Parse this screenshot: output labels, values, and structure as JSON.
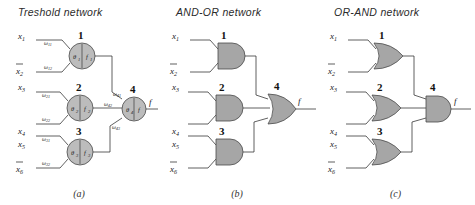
{
  "figure": {
    "caption_a": "(a)",
    "caption_b": "(b)",
    "caption_c": "(c)"
  },
  "panels": {
    "a": {
      "title": "Treshold network",
      "inputs": [
        {
          "base": "x",
          "sub": "1",
          "overbar": false
        },
        {
          "base": "x",
          "sub": "2",
          "overbar": true
        },
        {
          "base": "x",
          "sub": "3",
          "overbar": false
        },
        {
          "base": "x",
          "sub": "4",
          "overbar": false
        },
        {
          "base": "x",
          "sub": "5",
          "overbar": false
        },
        {
          "base": "x",
          "sub": "6",
          "overbar": true
        }
      ],
      "nodes": [
        {
          "number": "1",
          "theta": "θ",
          "theta_sub": "1",
          "func": "f",
          "func_sub": "1"
        },
        {
          "number": "2",
          "theta": "θ",
          "theta_sub": "2",
          "func": "f",
          "func_sub": "2"
        },
        {
          "number": "3",
          "theta": "θ",
          "theta_sub": "3",
          "func": "f",
          "func_sub": "3"
        },
        {
          "number": "4",
          "theta": "θ",
          "theta_sub": "4",
          "func": "f",
          "func_sub": ""
        }
      ],
      "weights": [
        {
          "sym": "ω",
          "sub": "11"
        },
        {
          "sym": "ω",
          "sub": "12"
        },
        {
          "sym": "ω",
          "sub": "21"
        },
        {
          "sym": "ω",
          "sub": "22"
        },
        {
          "sym": "ω",
          "sub": "31"
        },
        {
          "sym": "ω",
          "sub": "32"
        },
        {
          "sym": "ω",
          "sub": "41"
        },
        {
          "sym": "ω",
          "sub": "42"
        },
        {
          "sym": "ω",
          "sub": "43"
        }
      ],
      "output": "f"
    },
    "b": {
      "title": "AND-OR network",
      "inputs": [
        {
          "base": "x",
          "sub": "1",
          "overbar": false
        },
        {
          "base": "x",
          "sub": "2",
          "overbar": true
        },
        {
          "base": "x",
          "sub": "3",
          "overbar": false
        },
        {
          "base": "x",
          "sub": "4",
          "overbar": false
        },
        {
          "base": "x",
          "sub": "5",
          "overbar": false
        },
        {
          "base": "x",
          "sub": "6",
          "overbar": true
        }
      ],
      "gates": [
        {
          "number": "1",
          "type": "AND"
        },
        {
          "number": "2",
          "type": "AND"
        },
        {
          "number": "3",
          "type": "AND"
        },
        {
          "number": "4",
          "type": "OR"
        }
      ],
      "output": "f"
    },
    "c": {
      "title": "OR-AND network",
      "inputs": [
        {
          "base": "x",
          "sub": "1",
          "overbar": false
        },
        {
          "base": "x",
          "sub": "2",
          "overbar": true
        },
        {
          "base": "x",
          "sub": "3",
          "overbar": false
        },
        {
          "base": "x",
          "sub": "4",
          "overbar": false
        },
        {
          "base": "x",
          "sub": "5",
          "overbar": false
        },
        {
          "base": "x",
          "sub": "6",
          "overbar": true
        }
      ],
      "gates": [
        {
          "number": "1",
          "type": "OR"
        },
        {
          "number": "2",
          "type": "OR"
        },
        {
          "number": "3",
          "type": "OR"
        },
        {
          "number": "4",
          "type": "AND"
        }
      ],
      "output": "f"
    }
  },
  "colors": {
    "gate_fill": "#a6a6a6",
    "node_fill": "#bcbcbc",
    "stroke": "#4a4a4a",
    "wire": "#2c2c2c",
    "background": "#ffffff"
  }
}
